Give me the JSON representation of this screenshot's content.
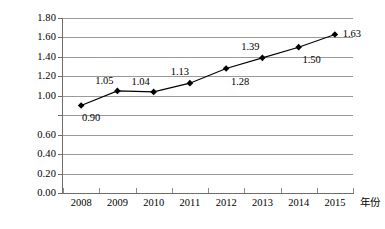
{
  "chart_data": {
    "type": "line",
    "title": "",
    "subtitle": "",
    "xlabel": "年份",
    "ylabel": "",
    "categories": [
      "2008",
      "2009",
      "2010",
      "2011",
      "2012",
      "2013",
      "2014",
      "2015"
    ],
    "values": [
      0.9,
      1.05,
      1.04,
      1.13,
      1.28,
      1.39,
      1.5,
      1.63
    ],
    "data_labels": [
      "0.90",
      "1.05",
      "1.04",
      "1.13",
      "1.28",
      "1.39",
      "1.50",
      "1.63"
    ],
    "ylim": [
      0.0,
      1.8
    ],
    "ytick_values": [
      1.8,
      1.6,
      1.4,
      1.2,
      1.0,
      0.8,
      0.6,
      0.4,
      0.2,
      0.0
    ],
    "ytick_labels": [
      "1.80",
      "1.60",
      "1.40",
      "1.20",
      "1.00",
      "",
      "0.60",
      "0.40",
      "0.20",
      "0.00"
    ],
    "grid": true,
    "grid_axis": "y",
    "legend": false,
    "legend_position": "none",
    "marker": "diamond",
    "series_color": "#000000",
    "grid_color": "#9a9a9a",
    "axis_color": "#6d6d6d",
    "background_color": "#ffffff",
    "label_offsets": [
      {
        "dx": 10,
        "dy": 11
      },
      {
        "dx": -13,
        "dy": -11
      },
      {
        "dx": -13,
        "dy": -11
      },
      {
        "dx": -10,
        "dy": -12
      },
      {
        "dx": 14,
        "dy": 12
      },
      {
        "dx": -12,
        "dy": -12
      },
      {
        "dx": 13,
        "dy": 12
      },
      {
        "dx": 17,
        "dy": -2
      }
    ]
  }
}
